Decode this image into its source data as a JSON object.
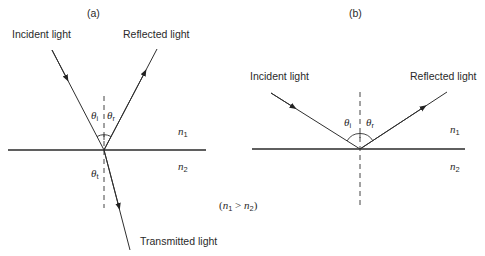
{
  "figure": {
    "panel_a": {
      "label": "(a)",
      "incident": "Incident light",
      "reflected": "Reflected light",
      "transmitted": "Transmitted light",
      "theta_i": "θ",
      "theta_i_sub": "i",
      "theta_r": "θ",
      "theta_r_sub": "r",
      "theta_t": "θ",
      "theta_t_sub": "t",
      "n1": "n",
      "n1_sub": "1",
      "n2": "n",
      "n2_sub": "2"
    },
    "panel_b": {
      "label": "(b)",
      "incident": "Incident light",
      "reflected": "Reflected light",
      "theta_i": "θ",
      "theta_i_sub": "i",
      "theta_r": "θ",
      "theta_r_sub": "r",
      "n1": "n",
      "n1_sub": "1",
      "n2": "n",
      "n2_sub": "2"
    },
    "condition": {
      "open": "(",
      "n1": "n",
      "n1_sub": "1",
      "gt": " > ",
      "n2": "n",
      "n2_sub": "2",
      "close": ")"
    }
  }
}
